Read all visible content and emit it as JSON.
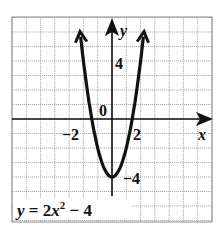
{
  "chart_data": {
    "type": "line",
    "title": "",
    "equation": "y = 2x² − 4",
    "equation_parts": {
      "lhs": "y",
      "eq": " = 2",
      "var": "x",
      "exp": "2",
      "rest": " − 4"
    },
    "xlabel": "x",
    "ylabel": "y",
    "xlim": [
      -7,
      7
    ],
    "ylim": [
      -7,
      7
    ],
    "grid": true,
    "x_ticks_labeled": [
      {
        "value": -2,
        "label": "−2"
      },
      {
        "value": 2,
        "label": "2"
      }
    ],
    "y_ticks_labeled": [
      {
        "value": 4,
        "label": "4"
      },
      {
        "value": -4,
        "label": "−4"
      }
    ],
    "origin_label": "0",
    "series": [
      {
        "name": "y = 2x^2 - 4",
        "x": [
          -2.35,
          -2,
          -1.5,
          -1,
          -0.5,
          0,
          0.5,
          1,
          1.5,
          2,
          2.35
        ],
        "y": [
          7.05,
          4,
          0.5,
          -2,
          -3.5,
          -4,
          -3.5,
          -2,
          0.5,
          4,
          7.05
        ],
        "color": "#111111",
        "arrows_at_ends": true
      }
    ],
    "vertex": {
      "x": 0,
      "y": -4
    },
    "x_intercepts": [
      -1.414,
      1.414
    ]
  },
  "labels": {
    "origin": "0",
    "x_axis": "x",
    "y_axis": "y",
    "x_neg2": "−2",
    "x_pos2": "2",
    "y_pos4": "4",
    "y_neg4": "−4"
  }
}
